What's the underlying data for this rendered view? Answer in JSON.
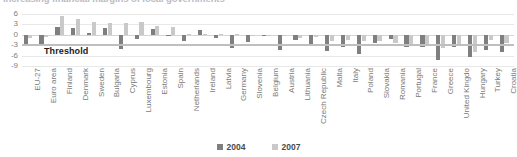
{
  "chart_data": {
    "type": "bar",
    "title": "Increasing financial margins of local governments",
    "xlabel": "",
    "ylabel": "",
    "ylim": [
      -9,
      6
    ],
    "yticks": [
      6,
      3,
      0,
      -3,
      -6,
      -9
    ],
    "grid": true,
    "legend_position": "bottom",
    "categories": [
      "EU-27",
      "Euro area",
      "Finland",
      "Denmark",
      "Sweden",
      "Bulgaria",
      "Cyprus",
      "Luxembourg",
      "Estonia",
      "Spain",
      "Netherlands",
      "Ireland",
      "Latvia",
      "Germany",
      "Slovenia",
      "Belgium",
      "Austria",
      "Lithuania",
      "Czech Republic",
      "Malta",
      "Italy",
      "Poland",
      "Slovakia",
      "Romania",
      "Portugal",
      "France",
      "Greece",
      "United Kingdo",
      "Hungary",
      "Turkey",
      "Croatia"
    ],
    "series": [
      {
        "name": "2004",
        "color": "#7f7f7f",
        "values": [
          -2.9,
          -3.0,
          2.3,
          1.9,
          0.6,
          1.9,
          -4.1,
          -1.1,
          1.6,
          -0.1,
          -1.7,
          1.3,
          -1.0,
          -3.8,
          -2.2,
          -0.3,
          -4.4,
          -1.5,
          -2.9,
          -4.7,
          -3.5,
          -5.4,
          -2.4,
          -1.2,
          -3.4,
          -3.6,
          -7.4,
          -3.5,
          -6.5,
          -4.3,
          -4.9
        ]
      },
      {
        "name": "2007",
        "color": "#c9c9c9",
        "values": [
          -0.9,
          -0.6,
          5.3,
          4.5,
          3.6,
          3.4,
          3.4,
          3.7,
          2.6,
          2.2,
          0.2,
          0.3,
          0.1,
          0.2,
          0.0,
          -0.2,
          -0.4,
          -1.0,
          -0.6,
          -1.8,
          -1.5,
          -1.9,
          -1.9,
          -2.5,
          -2.6,
          -2.7,
          -3.7,
          -2.7,
          -5.0,
          -1.6,
          -2.5
        ]
      }
    ],
    "annotations": [
      {
        "label": "Threshold",
        "value": -3,
        "orientation": "horizontal"
      }
    ]
  },
  "legend": {
    "items": [
      {
        "label": "2004",
        "color": "#7f7f7f"
      },
      {
        "label": "2007",
        "color": "#c9c9c9"
      }
    ]
  }
}
